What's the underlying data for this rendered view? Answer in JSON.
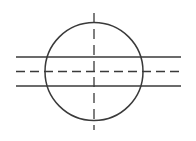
{
  "drawing": {
    "title": "Circle with horizontal centerline and two parallel edge lines",
    "canvas": {
      "width": 196,
      "height": 141,
      "background_color": "#ffffff"
    },
    "style": {
      "stroke_color": "#3a3a3a",
      "outline_width": 1.5,
      "edge_width": 1.4,
      "centerline_width": 1.3,
      "centerline_dash": "9 5",
      "vertical_centerline_dash": "10 6"
    },
    "elements": {
      "circle": {
        "label": "Circle outline",
        "center_x": 94,
        "center_y": 71.5,
        "radius": 49,
        "line_type": "continuous-thick"
      },
      "vertical_centerline": {
        "label": "Vertical centerline",
        "x": 94,
        "y_start": 13,
        "y_end": 130,
        "line_type": "dash-dot-center"
      },
      "horizontal_centerline": {
        "label": "Horizontal centerline",
        "y": 71.5,
        "x_start": 16,
        "x_end": 181,
        "line_type": "dash-dot-center"
      },
      "upper_edge_line": {
        "label": "Upper parallel edge line",
        "y": 57,
        "x_start": 16,
        "x_end": 181,
        "line_type": "continuous-thick"
      },
      "lower_edge_line": {
        "label": "Lower parallel edge line",
        "y": 86,
        "x_start": 16,
        "x_end": 181,
        "line_type": "continuous-thick"
      }
    }
  }
}
